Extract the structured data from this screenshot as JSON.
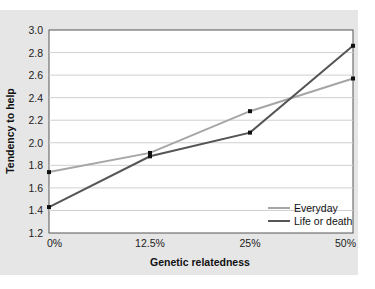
{
  "chart_data": {
    "type": "line",
    "title": "",
    "xlabel": "Genetic relatedness",
    "ylabel": "Tendency to help",
    "categories": [
      "0%",
      "12.5%",
      "25%",
      "50%"
    ],
    "ylim": [
      1.2,
      3.0
    ],
    "yticks": [
      "1.2",
      "1.4",
      "1.6",
      "1.8",
      "2.0",
      "2.2",
      "2.4",
      "2.6",
      "2.8",
      "3.0"
    ],
    "grid": true,
    "legend_position": "lower right",
    "series": [
      {
        "name": "Everyday",
        "color": "#a6a6a6",
        "values": [
          1.74,
          1.91,
          2.28,
          2.57
        ]
      },
      {
        "name": "Life or death",
        "color": "#555555",
        "values": [
          1.43,
          1.88,
          2.09,
          2.86
        ]
      }
    ]
  },
  "colors": {
    "panel_background": "#e6e6e6",
    "plot_background": "#ffffff",
    "gridline": "#d0d0d0",
    "marker": "#111111"
  }
}
